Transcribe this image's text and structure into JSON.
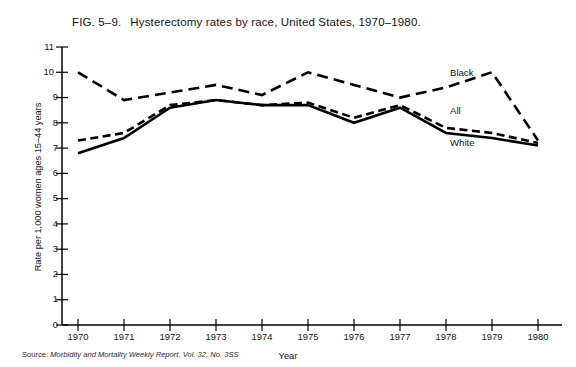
{
  "figure": {
    "number": "FIG. 5–9.",
    "title": "Hysterectomy rates by race, United States, 1970–1980.",
    "source": "Source:",
    "source_text": "Morbidity and Mortality Weekly Report, Vol. 32, No. 3SS"
  },
  "chart_data": {
    "type": "line",
    "title": "Hysterectomy rates by race, United States, 1970–1980.",
    "xlabel": "Year",
    "ylabel": "Rate per 1,000 women ages 15–44 years",
    "x": [
      1970,
      1971,
      1972,
      1973,
      1974,
      1975,
      1976,
      1977,
      1978,
      1979,
      1980
    ],
    "xtick_labels": [
      "1970",
      "1971",
      "1972",
      "1973",
      "1974",
      "1975",
      "1976",
      "1977",
      "1978",
      "1979",
      "1980"
    ],
    "ytick_labels": [
      "0",
      "1",
      "2",
      "3",
      "4",
      "5",
      "6",
      "7",
      "8",
      "9",
      "10",
      "11"
    ],
    "xlim": [
      1970,
      1980
    ],
    "ylim": [
      0,
      11
    ],
    "grid": false,
    "legend_position": "inline-right",
    "series": [
      {
        "name": "Black",
        "style": "long-dash",
        "color": "#000000",
        "values": [
          10.0,
          8.9,
          9.2,
          9.5,
          9.1,
          10.0,
          9.5,
          9.0,
          9.4,
          10.0,
          7.3
        ]
      },
      {
        "name": "All",
        "style": "short-dash",
        "color": "#000000",
        "values": [
          7.3,
          7.6,
          8.7,
          8.9,
          8.7,
          8.8,
          8.2,
          8.7,
          7.8,
          7.6,
          7.2
        ]
      },
      {
        "name": "White",
        "style": "solid",
        "color": "#000000",
        "values": [
          6.8,
          7.4,
          8.6,
          8.9,
          8.7,
          8.7,
          8.0,
          8.6,
          7.6,
          7.4,
          7.1
        ]
      }
    ],
    "annotations": [
      {
        "text": "Black",
        "x": 1979.0,
        "y": 10.5
      },
      {
        "text": "All",
        "x": 1979.0,
        "y": 8.3
      },
      {
        "text": "White",
        "x": 1979.0,
        "y": 7.2
      }
    ]
  }
}
